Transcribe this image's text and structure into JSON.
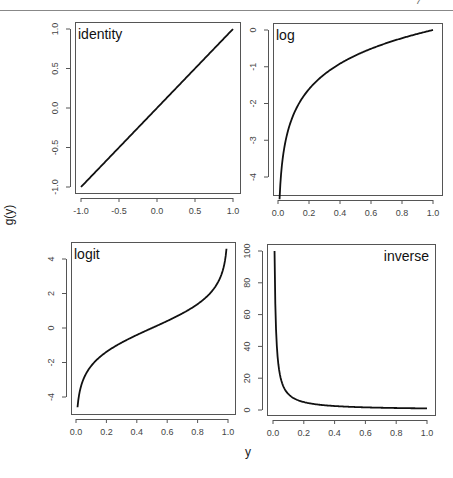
{
  "page": {
    "page_number_fragment": "7"
  },
  "figure": {
    "shared_ylabel": "g(y)",
    "shared_xlabel": "y"
  },
  "chart_data": [
    {
      "type": "line",
      "title": "identity",
      "title_position": "top-left",
      "xlabel": "",
      "ylabel": "g(y)",
      "xlim": [
        -1.0,
        1.0
      ],
      "ylim": [
        -1.0,
        1.0
      ],
      "xticks": [
        "-1.0",
        "-0.5",
        "0.0",
        "0.5",
        "1.0"
      ],
      "yticks": [
        "-1.0",
        "-0.5",
        "0.0",
        "0.5",
        "1.0"
      ],
      "function": "g(y) = y",
      "x": [
        -1.0,
        -0.5,
        0.0,
        0.5,
        1.0
      ],
      "y": [
        -1.0,
        -0.5,
        0.0,
        0.5,
        1.0
      ]
    },
    {
      "type": "line",
      "title": "log",
      "title_position": "top-left",
      "xlabel": "",
      "ylabel": "",
      "xlim": [
        0.0,
        1.0
      ],
      "ylim": [
        -4.6,
        0.0
      ],
      "xticks": [
        "0.0",
        "0.2",
        "0.4",
        "0.6",
        "0.8",
        "1.0"
      ],
      "yticks": [
        "-4",
        "-3",
        "-2",
        "-1",
        "0"
      ],
      "function": "g(y) = log(y)",
      "x": [
        0.01,
        0.05,
        0.1,
        0.2,
        0.4,
        0.6,
        0.8,
        1.0
      ],
      "y": [
        -4.61,
        -3.0,
        -2.3,
        -1.61,
        -0.92,
        -0.51,
        -0.22,
        0.0
      ]
    },
    {
      "type": "line",
      "title": "logit",
      "title_position": "top-left",
      "xlabel": "y",
      "ylabel": "",
      "xlim": [
        0.0,
        1.0
      ],
      "ylim": [
        -4.6,
        4.6
      ],
      "xticks": [
        "0.0",
        "0.2",
        "0.4",
        "0.6",
        "0.8",
        "1.0"
      ],
      "yticks": [
        "-4",
        "-2",
        "0",
        "2",
        "4"
      ],
      "function": "g(y) = log(y/(1-y))",
      "x": [
        0.01,
        0.05,
        0.1,
        0.2,
        0.4,
        0.5,
        0.6,
        0.8,
        0.9,
        0.95,
        0.99
      ],
      "y": [
        -4.6,
        -2.94,
        -2.2,
        -1.39,
        -0.41,
        0.0,
        0.41,
        1.39,
        2.2,
        2.94,
        4.6
      ]
    },
    {
      "type": "line",
      "title": "inverse",
      "title_position": "top-right",
      "xlabel": "y",
      "ylabel": "",
      "xlim": [
        0.0,
        1.0
      ],
      "ylim": [
        0,
        100
      ],
      "xticks": [
        "0.0",
        "0.2",
        "0.4",
        "0.6",
        "0.8",
        "1.0"
      ],
      "yticks": [
        "0",
        "20",
        "40",
        "60",
        "80",
        "100"
      ],
      "function": "g(y) = 1/y",
      "x": [
        0.01,
        0.02,
        0.05,
        0.1,
        0.2,
        0.4,
        0.6,
        0.8,
        1.0
      ],
      "y": [
        100,
        50,
        20,
        10,
        5,
        2.5,
        1.67,
        1.25,
        1.0
      ]
    }
  ],
  "layout": {
    "panels": [
      {
        "box": [
          75,
          22,
          240,
          193
        ],
        "xpx": [
          81,
          233
        ],
        "ypx": [
          187,
          29
        ],
        "xval": [
          -1,
          1
        ],
        "yval": [
          -1,
          1
        ],
        "ytickvals": [
          -1,
          -0.5,
          0,
          0.5,
          1
        ],
        "xtickvals": [
          -1,
          -0.5,
          0,
          0.5,
          1
        ],
        "fn": "identity",
        "xrange": [
          -1,
          1
        ],
        "title_anchor": "start"
      },
      {
        "box": [
          273,
          23,
          442,
          195
        ],
        "xpx": [
          278,
          433
        ],
        "ypx": [
          177,
          30
        ],
        "xval": [
          0,
          1
        ],
        "yval": [
          -4,
          0
        ],
        "ytickvals": [
          -4,
          -3,
          -2,
          -1,
          0
        ],
        "xtickvals": [
          0,
          0.2,
          0.4,
          0.6,
          0.8,
          1
        ],
        "fn": "log",
        "xrange": [
          0.01,
          1
        ],
        "title_anchor": "start"
      },
      {
        "box": [
          71,
          242,
          235,
          414
        ],
        "xpx": [
          76,
          228
        ],
        "ypx": [
          397,
          259
        ],
        "xval": [
          0,
          1
        ],
        "yval": [
          -4,
          4
        ],
        "ytickvals": [
          -4,
          -2,
          0,
          2,
          4
        ],
        "xtickvals": [
          0,
          0.2,
          0.4,
          0.6,
          0.8,
          1
        ],
        "fn": "logit",
        "xrange": [
          0.01,
          0.99
        ],
        "title_anchor": "start"
      },
      {
        "box": [
          267,
          244,
          435,
          415
        ],
        "xpx": [
          273,
          427
        ],
        "ypx": [
          410,
          251
        ],
        "xval": [
          0,
          1
        ],
        "yval": [
          0,
          100
        ],
        "ytickvals": [
          0,
          20,
          40,
          60,
          80,
          100
        ],
        "xtickvals": [
          0,
          0.2,
          0.4,
          0.6,
          0.8,
          1
        ],
        "fn": "inverse",
        "xrange": [
          0.01,
          1
        ],
        "title_anchor": "end"
      }
    ]
  }
}
